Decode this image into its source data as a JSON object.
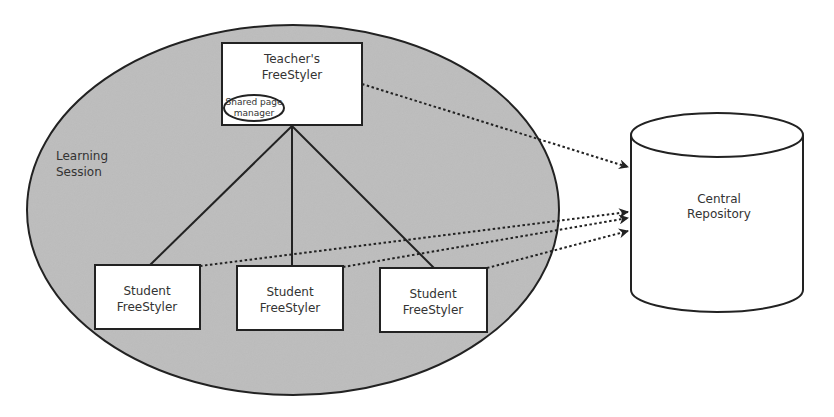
{
  "diagram": {
    "learning_session": {
      "label_line1": "Learning",
      "label_line2": "Session",
      "fill": "#bdbdbd",
      "stroke": "#222222"
    },
    "teacher": {
      "line1": "Teacher's",
      "line2": "FreeStyler",
      "shared_page_manager": {
        "line1": "Shared page",
        "line2": "manager"
      }
    },
    "students": [
      {
        "line1": "Student",
        "line2": "FreeStyler"
      },
      {
        "line1": "Student",
        "line2": "FreeStyler"
      },
      {
        "line1": "Student",
        "line2": "FreeStyler"
      }
    ],
    "repository": {
      "line1": "Central",
      "line2": "Repository"
    },
    "edges": {
      "hierarchy": [
        "Teacher's FreeStyler → Student FreeStyler 1",
        "Teacher's FreeStyler → Student FreeStyler 2",
        "Teacher's FreeStyler → Student FreeStyler 3"
      ],
      "dotted_arrows": [
        "Teacher's FreeStyler → Central Repository",
        "Student FreeStyler 1 → Central Repository",
        "Student FreeStyler 2 → Central Repository",
        "Student FreeStyler 3 → Central Repository"
      ]
    },
    "colors": {
      "line": "#222222",
      "box_fill": "#ffffff",
      "text": "#333333"
    }
  }
}
